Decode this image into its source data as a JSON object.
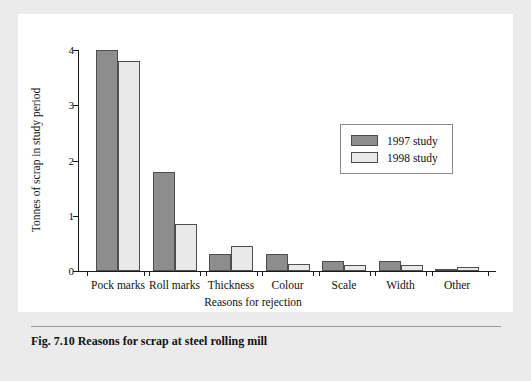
{
  "figure": {
    "caption": "Fig. 7.10  Reasons for scrap at steel rolling mill"
  },
  "chart_data": {
    "type": "bar",
    "title": "",
    "xlabel": "Reasons for rejection",
    "ylabel": "Tonnes of scrap in study period",
    "ylim": [
      0,
      4
    ],
    "yticks": [
      "0",
      "1",
      "2",
      "3",
      "4"
    ],
    "grid": false,
    "legend_position": "upper right",
    "categories": [
      "Pock marks",
      "Roll marks",
      "Thickness",
      "Colour",
      "Scale",
      "Width",
      "Other"
    ],
    "series": [
      {
        "name": "1997 study",
        "color": "#8d8d8d",
        "values": [
          4.0,
          1.8,
          0.3,
          0.3,
          0.18,
          0.18,
          0.04
        ]
      },
      {
        "name": "1998 study",
        "color": "#e9e9e9",
        "values": [
          3.8,
          0.85,
          0.45,
          0.13,
          0.1,
          0.1,
          0.07
        ]
      }
    ]
  }
}
